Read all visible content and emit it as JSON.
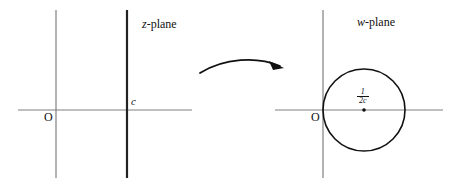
{
  "figure": {
    "background_color": "#ffffff",
    "ink_color": "#111111",
    "axis_color": "#808080"
  },
  "z_plane": {
    "label_prefix": "z",
    "label_suffix": "-plane",
    "label_full": "z-plane",
    "origin_label": "O",
    "line_label": "c",
    "axis": {
      "horizontal": {
        "x1": 18,
        "x2": 192,
        "y": 110
      },
      "vertical": {
        "x": 56,
        "y1": 10,
        "y2": 178
      }
    },
    "vertical_line": {
      "x": 127,
      "y1": 10,
      "y2": 178,
      "stroke_width": 2.2
    }
  },
  "w_plane": {
    "label_prefix": "w",
    "label_suffix": "-plane",
    "label_full": "w-plane",
    "origin_label": "O",
    "center_label_numerator": "1",
    "center_label_denominator": "2c",
    "center_label_full": "1/2c",
    "axis": {
      "horizontal": {
        "x1": 275,
        "x2": 443,
        "y": 110
      },
      "vertical": {
        "x": 323,
        "y1": 10,
        "y2": 178
      }
    },
    "circle": {
      "cx": 364,
      "cy": 110,
      "r": 41,
      "stroke_width": 1.6
    }
  },
  "arrow": {
    "name": "mapping-arrow",
    "description": "curved arrow from z-plane to w-plane",
    "path": "M 200 73 C 225 58, 258 57, 281 66",
    "head_points": "281,66 270,62 272,70"
  }
}
